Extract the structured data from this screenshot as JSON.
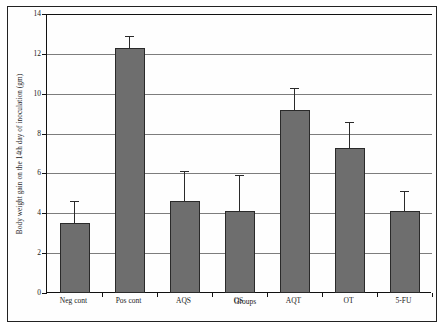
{
  "chart_data": {
    "type": "bar",
    "title": "",
    "xlabel": "Groups",
    "ylabel": "Body weight gain on the 14th day of inoculation (gm)",
    "categories": [
      "Neg cont",
      "Pos cont",
      "AQS",
      "OS",
      "AQT",
      "OT",
      "5-FU"
    ],
    "values": [
      3.5,
      12.3,
      4.6,
      4.1,
      9.2,
      7.3,
      4.1
    ],
    "errors_upper": [
      4.6,
      12.9,
      6.1,
      5.9,
      10.3,
      8.6,
      5.1
    ],
    "error_bars": [
      1.1,
      0.6,
      1.5,
      1.8,
      1.1,
      1.3,
      1.0
    ],
    "ylim": [
      0,
      14
    ],
    "yticks": [
      0,
      2,
      4,
      6,
      8,
      10,
      12,
      14
    ],
    "ytick_labels": [
      "0",
      "2",
      "4",
      "6",
      "8",
      "10",
      "12",
      "14"
    ],
    "grid": true,
    "legend": "none",
    "bar_color": "#6e6e6e",
    "bar_border_color": "#2a2a2a",
    "grid_color": "#7d7d7d",
    "axis_color": "#111111"
  }
}
